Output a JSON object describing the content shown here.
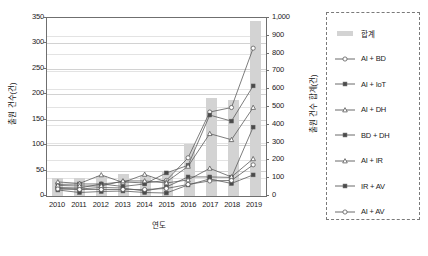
{
  "chart_data": {
    "type": "line",
    "title": "",
    "xlabel": "연도",
    "ylabel": "출원 건수(건)",
    "ylabel_right": "출원 건수 합계(건)",
    "categories": [
      "2010",
      "2011",
      "2012",
      "2013",
      "2014",
      "2015",
      "2016",
      "2017",
      "2018",
      "2019"
    ],
    "ylim": [
      0,
      350
    ],
    "yticks": [
      0,
      50,
      100,
      150,
      200,
      250,
      300,
      350
    ],
    "ylim_right": [
      0,
      1000
    ],
    "yticks_right": [
      "0",
      "100",
      "200",
      "300",
      "400",
      "500",
      "600",
      "700",
      "800",
      "900",
      "1,000"
    ],
    "grid": true,
    "legend_position": "right-outside",
    "series": [
      {
        "name": "합계",
        "type": "bar",
        "axis": "right",
        "marker": "bar",
        "values": [
          100,
          100,
          112,
          125,
          110,
          140,
          292,
          552,
          540,
          982
        ]
      },
      {
        "name": "AI + BD",
        "type": "line",
        "axis": "left",
        "marker": "open-circle",
        "values": [
          13,
          12,
          20,
          24,
          22,
          27,
          72,
          163,
          172,
          290
        ]
      },
      {
        "name": "AI + IoT",
        "type": "line",
        "axis": "left",
        "marker": "filled-square",
        "values": [
          19,
          20,
          20,
          15,
          20,
          42,
          57,
          157,
          145,
          215
        ]
      },
      {
        "name": "AI + DH",
        "type": "line",
        "axis": "left",
        "marker": "open-triangle",
        "values": [
          24,
          21,
          38,
          23,
          39,
          24,
          55,
          120,
          108,
          172
        ]
      },
      {
        "name": "BD + DH",
        "type": "line",
        "axis": "left",
        "marker": "filled-square",
        "values": [
          11,
          10,
          13,
          12,
          6,
          14,
          34,
          34,
          33,
          133
        ]
      },
      {
        "name": "AI + IR",
        "type": "line",
        "axis": "left",
        "marker": "open-triangle",
        "values": [
          17,
          16,
          16,
          26,
          26,
          22,
          28,
          51,
          34,
          70
        ]
      },
      {
        "name": "IR + AV",
        "type": "line",
        "axis": "left",
        "marker": "filled-square",
        "values": [
          8,
          3,
          5,
          6,
          3,
          2,
          18,
          30,
          21,
          38
        ]
      },
      {
        "name": "AI + AV",
        "type": "line",
        "axis": "left",
        "marker": "open-circle",
        "values": [
          10,
          9,
          9,
          9,
          9,
          11,
          19,
          26,
          27,
          58
        ]
      }
    ]
  },
  "legend": {
    "entries": [
      {
        "label": "합계",
        "marker": "bar"
      },
      {
        "label": "AI + BD",
        "marker": "open-circle"
      },
      {
        "label": "AI + IoT",
        "marker": "filled-square"
      },
      {
        "label": "AI + DH",
        "marker": "open-triangle"
      },
      {
        "label": "BD + DH",
        "marker": "filled-square"
      },
      {
        "label": "AI + IR",
        "marker": "open-triangle"
      },
      {
        "label": "IR + AV",
        "marker": "filled-square"
      },
      {
        "label": "AI + AV",
        "marker": "open-circle"
      }
    ]
  },
  "colors": {
    "bar": "#d3d3d3",
    "line": "#5a5a5a",
    "grid": "#d2d2d2",
    "axis": "#6f6f6f",
    "text": "#1a1a1a"
  }
}
